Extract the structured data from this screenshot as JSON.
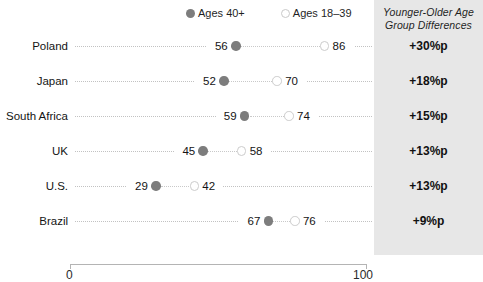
{
  "legend": {
    "items": [
      {
        "label": "Ages 40+",
        "style": "filled",
        "icon": "filled-dot-icon"
      },
      {
        "label": "Ages 18–39",
        "style": "open",
        "icon": "open-dot-icon"
      }
    ]
  },
  "panel": {
    "title": "Younger-Older Age Group Differences",
    "values": [
      "+30%p",
      "+18%p",
      "+15%p",
      "+13%p",
      "+13%p",
      "+9%p"
    ]
  },
  "axis": {
    "min_label": "0",
    "max_label": "100"
  },
  "rows": [
    {
      "label": "Poland",
      "older": "56",
      "younger": "86",
      "diff": "+30%p"
    },
    {
      "label": "Japan",
      "older": "52",
      "younger": "70",
      "diff": "+18%p"
    },
    {
      "label": "South Africa",
      "older": "59",
      "younger": "74",
      "diff": "+15%p"
    },
    {
      "label": "UK",
      "older": "45",
      "younger": "58",
      "diff": "+13%p"
    },
    {
      "label": "U.S.",
      "older": "29",
      "younger": "42",
      "diff": "+13%p"
    },
    {
      "label": "Brazil",
      "older": "67",
      "younger": "76",
      "diff": "+9%p"
    }
  ],
  "colors": {
    "older_dot": "#7d7d7d",
    "younger_dot_ring": "#cccccc",
    "panel_bg": "#e7e7e7",
    "leader": "#c2c2c2",
    "axis": "#b4b4b4"
  },
  "chart_data": {
    "type": "scatter",
    "subtype": "dumbbell",
    "title": "",
    "xlabel": "",
    "ylabel": "",
    "xlim": [
      0,
      100
    ],
    "xticks": [
      0,
      100
    ],
    "xticklabels": [
      "0",
      "100"
    ],
    "grid": false,
    "legend_position": "top",
    "categories": [
      "Poland",
      "Japan",
      "South Africa",
      "UK",
      "U.S.",
      "Brazil"
    ],
    "series": [
      {
        "name": "Ages 40+",
        "values": [
          56,
          52,
          59,
          45,
          29,
          67
        ]
      },
      {
        "name": "Ages 18–39",
        "values": [
          86,
          70,
          74,
          58,
          42,
          76
        ]
      }
    ],
    "annotations": {
      "column_title": "Younger-Older Age Group Differences",
      "values": [
        "+30%p",
        "+18%p",
        "+15%p",
        "+13%p",
        "+13%p",
        "+9%p"
      ]
    }
  }
}
